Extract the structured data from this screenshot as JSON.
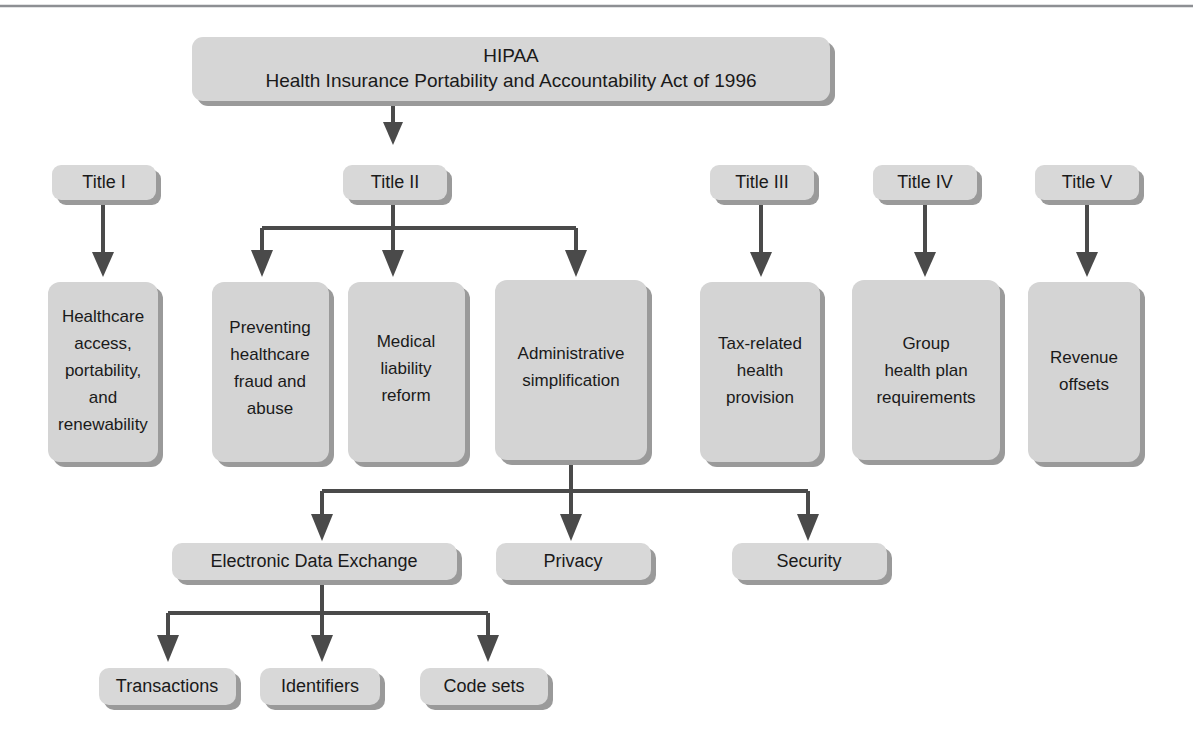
{
  "figure": {
    "colors": {
      "box_fill_light": "#d3d3d3",
      "box_fill_lighter": "#dadada",
      "box_shadow": "#9a9a9a",
      "connector": "#4a4a4a",
      "text": "#1a1a1a",
      "page_background": "#ffffff",
      "top_rule": "#8d8f93"
    }
  },
  "nodes": {
    "root": {
      "id": "hipaa",
      "line1": "HIPAA",
      "line2": "Health Insurance Portability and Accountability Act of 1996"
    },
    "titles": [
      {
        "id": "title-1",
        "label": "Title I"
      },
      {
        "id": "title-2",
        "label": "Title II"
      },
      {
        "id": "title-3",
        "label": "Title III"
      },
      {
        "id": "title-4",
        "label": "Title IV"
      },
      {
        "id": "title-5",
        "label": "Title V"
      }
    ],
    "details": [
      {
        "id": "healthcare-access",
        "parent": "title-1",
        "lines": [
          "Healthcare",
          "access,",
          "portability,",
          "and",
          "renewability"
        ]
      },
      {
        "id": "preventing-fraud",
        "parent": "title-2",
        "lines": [
          "Preventing",
          "healthcare",
          "fraud and",
          "abuse"
        ]
      },
      {
        "id": "medical-liability",
        "parent": "title-2",
        "lines": [
          "Medical",
          "liability",
          "reform"
        ]
      },
      {
        "id": "administrative-simplification",
        "parent": "title-2",
        "lines": [
          "Administrative",
          "simplification"
        ]
      },
      {
        "id": "tax-related-health",
        "parent": "title-3",
        "lines": [
          "Tax-related",
          "health",
          "provision"
        ]
      },
      {
        "id": "group-health-plan",
        "parent": "title-4",
        "lines": [
          "Group",
          "health plan",
          "requirements"
        ]
      },
      {
        "id": "revenue-offsets",
        "parent": "title-5",
        "lines": [
          "Revenue",
          "offsets"
        ]
      }
    ],
    "admin_children": [
      {
        "id": "electronic-data-exchange",
        "label": "Electronic Data Exchange"
      },
      {
        "id": "privacy",
        "label": "Privacy"
      },
      {
        "id": "security",
        "label": "Security"
      }
    ],
    "ede_children": [
      {
        "id": "transactions",
        "label": "Transactions"
      },
      {
        "id": "identifiers",
        "label": "Identifiers"
      },
      {
        "id": "code-sets",
        "label": "Code sets"
      }
    ]
  }
}
